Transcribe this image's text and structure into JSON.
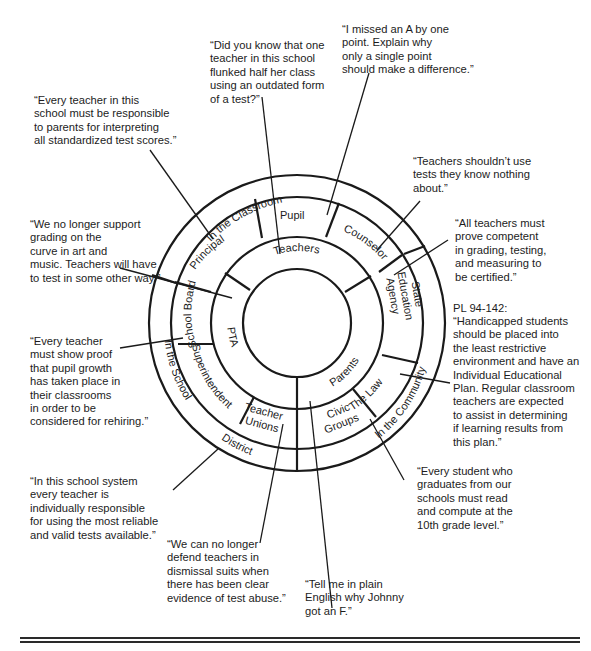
{
  "diagram": {
    "center": {
      "x": 297,
      "y": 323
    },
    "radii": {
      "core": 54,
      "teachers_ring": 86,
      "middle_ring": 126,
      "outer_ring": 148
    },
    "core_label": "Teachers",
    "middle_segments": [
      "Pupil",
      "Counselor",
      "State Education Agency",
      "Parents",
      "The Law",
      "Civic Groups",
      "Teacher Unions",
      "PTA",
      "Superintendent",
      "School Board",
      "Principal"
    ],
    "outer_bands": [
      "In the Classroom",
      "In the Community",
      "In the School District"
    ],
    "labels": {
      "teachers": "Teachers",
      "pupil": "Pupil",
      "counselor": "Counselor",
      "state": "State",
      "education": "Education",
      "agency": "Agency",
      "parents": "Parents",
      "the_law": "The Law",
      "civic": "Civic",
      "groups": "Groups",
      "teacher": "Teacher",
      "unions": "Unions",
      "pta": "PTA",
      "superintendent": "Superintendent",
      "school_board": "School  Board",
      "principal": "Principal",
      "in_the_classroom": "In the  Classroom",
      "in_the_community": "In the Community",
      "in_the_school": "In the School",
      "district": "District"
    }
  },
  "quotes": {
    "teachers_flunked": "“Did you know that one\nteacher in this school\nflunked half her class\nusing an outdated form\nof a test?”",
    "pupil": "“I missed an A by one\npoint. Explain why\nonly a single point\nshould make a difference.”",
    "principal": "“Every teacher in this\nschool must be responsible\nto parents for interpreting\nall standardized test scores.”",
    "counselor": "“Teachers shouldn’t use\ntests they know nothing\nabout.”",
    "school_board": "“We no longer support\ngrading on the\ncurve in art and\nmusic. Teachers will have\nto test in some other way.”",
    "state_agency": "“All teachers must\nprove competent\nin grading, testing,\nand measuring to\nbe certified.”",
    "law_heading": "PL 94-142:",
    "law": "“Handicapped students\nshould be placed into\nthe least restrictive\nenvironment and have an\nIndividual Educational\nPlan. Regular classroom\nteachers are expected\nto assist in determining\nif learning results from\nthis plan.”",
    "superintendent": "“Every teacher\nmust show proof\nthat pupil growth\nhas taken place in\ntheir classrooms\nin order to be\nconsidered for rehiring.”",
    "district": "“In this school system\nevery teacher is\nindividually responsible\nfor using the most reliable\nand valid tests available.”",
    "civic": "“Every student who\ngraduates from our\nschools must read\nand compute at the\n10th grade level.”",
    "unions": "“We can no longer\ndefend teachers in\ndismissal suits when\nthere has been clear\nevidence of test abuse.”",
    "parents": "“Tell me in plain\nEnglish why Johnny\ngot an F.”"
  }
}
